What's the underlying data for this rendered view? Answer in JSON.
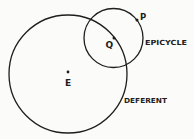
{
  "diagram": {
    "colors": {
      "background": "#fbfbf9",
      "ink": "#1e1e1e"
    },
    "circles": [
      {
        "id": "deferent",
        "label": "DEFERENT",
        "cx": 68,
        "cy": 74,
        "r": 59
      },
      {
        "id": "epicycle",
        "label": "EPICYCLE",
        "cx": 113.5,
        "cy": 38,
        "r": 29.5
      }
    ],
    "points": [
      {
        "id": "E",
        "label": "E",
        "x": 68,
        "y": 73,
        "description": "Earth, center of deferent"
      },
      {
        "id": "Q",
        "label": "Q",
        "x": 114,
        "y": 38,
        "description": "center of epicycle, on deferent"
      },
      {
        "id": "P",
        "label": "P",
        "x": 137,
        "y": 20,
        "description": "planet, on epicycle"
      }
    ],
    "labels": {
      "epicycle": "EPICYCLE",
      "deferent": "DEFERENT",
      "point_e": "E",
      "point_q": "Q",
      "point_p": "P"
    }
  }
}
